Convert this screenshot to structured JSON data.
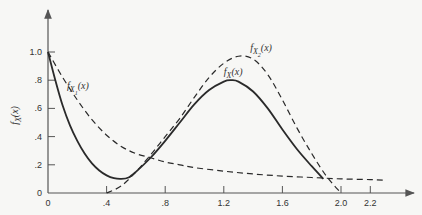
{
  "chart_data": {
    "type": "line",
    "title": "",
    "xlabel": "",
    "ylabel": "f_X(x)",
    "xlim": [
      0,
      2.45
    ],
    "ylim": [
      0,
      1.15
    ],
    "grid": false,
    "x_ticks": [
      {
        "value": 0,
        "label": "0"
      },
      {
        "value": 0.4,
        "label": ".4"
      },
      {
        "value": 0.8,
        "label": ".8"
      },
      {
        "value": 1.2,
        "label": "1.2"
      },
      {
        "value": 1.6,
        "label": "1.6"
      },
      {
        "value": 2.0,
        "label": "2.0"
      },
      {
        "value": 2.2,
        "label": "2.2"
      }
    ],
    "y_ticks": [
      {
        "value": 0,
        "label": "0"
      },
      {
        "value": 0.2,
        "label": ".2"
      },
      {
        "value": 0.4,
        "label": ".4"
      },
      {
        "value": 0.6,
        "label": ".6"
      },
      {
        "value": 0.8,
        "label": ".8"
      },
      {
        "value": 1.0,
        "label": "1.0"
      }
    ],
    "series": [
      {
        "name": "f_X(x)",
        "label_main": "f",
        "label_sub": "X",
        "label_sub2": "",
        "label_tail": "(x)",
        "style": "solid",
        "label_at": [
          1.2,
          0.84
        ],
        "points": [
          [
            0,
            1.0
          ],
          [
            0.05,
            0.8
          ],
          [
            0.1,
            0.62
          ],
          [
            0.15,
            0.48
          ],
          [
            0.2,
            0.37
          ],
          [
            0.25,
            0.28
          ],
          [
            0.3,
            0.21
          ],
          [
            0.35,
            0.16
          ],
          [
            0.4,
            0.125
          ],
          [
            0.45,
            0.105
          ],
          [
            0.5,
            0.1
          ],
          [
            0.55,
            0.11
          ],
          [
            0.6,
            0.15
          ],
          [
            0.7,
            0.25
          ],
          [
            0.8,
            0.37
          ],
          [
            0.9,
            0.5
          ],
          [
            1.0,
            0.63
          ],
          [
            1.1,
            0.73
          ],
          [
            1.2,
            0.79
          ],
          [
            1.25,
            0.8
          ],
          [
            1.3,
            0.79
          ],
          [
            1.4,
            0.72
          ],
          [
            1.5,
            0.6
          ],
          [
            1.6,
            0.45
          ],
          [
            1.7,
            0.31
          ],
          [
            1.8,
            0.19
          ],
          [
            1.88,
            0.1
          ]
        ]
      },
      {
        "name": "f_X1(x)",
        "label_main": "f",
        "label_sub": "X",
        "label_sub2": "1",
        "label_tail": "(x)",
        "style": "dashed",
        "label_at": [
          0.13,
          0.74
        ],
        "points": [
          [
            0,
            1.0
          ],
          [
            0.1,
            0.82
          ],
          [
            0.2,
            0.66
          ],
          [
            0.3,
            0.52
          ],
          [
            0.4,
            0.41
          ],
          [
            0.5,
            0.33
          ],
          [
            0.6,
            0.28
          ],
          [
            0.7,
            0.25
          ],
          [
            0.8,
            0.22
          ],
          [
            0.9,
            0.2
          ],
          [
            1.0,
            0.18
          ],
          [
            1.2,
            0.155
          ],
          [
            1.4,
            0.135
          ],
          [
            1.6,
            0.12
          ],
          [
            1.8,
            0.11
          ],
          [
            2.0,
            0.1
          ],
          [
            2.2,
            0.095
          ],
          [
            2.3,
            0.09
          ]
        ]
      },
      {
        "name": "f_X2(x)",
        "label_main": "f",
        "label_sub": "X",
        "label_sub2": "2",
        "label_tail": "(x)",
        "style": "dashed",
        "label_at": [
          1.38,
          1.01
        ],
        "points": [
          [
            0.4,
            0.0
          ],
          [
            0.5,
            0.05
          ],
          [
            0.6,
            0.15
          ],
          [
            0.7,
            0.27
          ],
          [
            0.8,
            0.4
          ],
          [
            0.9,
            0.53
          ],
          [
            1.0,
            0.68
          ],
          [
            1.1,
            0.82
          ],
          [
            1.2,
            0.92
          ],
          [
            1.3,
            0.97
          ],
          [
            1.4,
            0.95
          ],
          [
            1.5,
            0.84
          ],
          [
            1.6,
            0.66
          ],
          [
            1.7,
            0.46
          ],
          [
            1.8,
            0.28
          ],
          [
            1.9,
            0.12
          ],
          [
            2.0,
            0.0
          ]
        ]
      }
    ]
  }
}
